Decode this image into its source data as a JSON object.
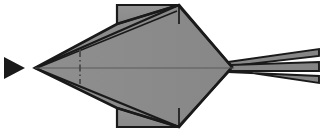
{
  "figure": {
    "title": "Origami folded model - top view",
    "type": "line-drawing",
    "width": 324,
    "height": 133,
    "background_color": "#ffffff",
    "paper_fill_color": "#8c8c8c",
    "paper_fill_color_light": "#979797",
    "paper_fill_color_dark": "#7e7e7e",
    "outline_color": "#1a1a1a",
    "crease_color": "#4a4a4a",
    "centerline_color": "#555555",
    "arrow_color": "#1a1a1a"
  },
  "markers": {
    "direction_arrow": {
      "name": "direction-arrow",
      "label": "solid triangle pointing right",
      "points": "4,57 25,68 4,79",
      "fill": "#1a1a1a"
    }
  },
  "geometry": {
    "body_outline": {
      "name": "paper-body-outline",
      "points": "35,68 118,23 178,5 232,67 178,127 118,112"
    },
    "tip_left": {
      "x": 35,
      "y": 68
    },
    "apex_top": {
      "x": 178,
      "y": 5
    },
    "apex_bottom": {
      "x": 178,
      "y": 127
    },
    "junction_right": {
      "x": 232,
      "y": 67
    },
    "flap_top": {
      "name": "top-rectangular-flap",
      "points": "118,5 178,5 178,23 118,23"
    },
    "flap_bottom": {
      "name": "bottom-rectangular-flap",
      "points": "118,127 178,127 178,110 118,110"
    },
    "tail_layers": [
      {
        "name": "tail-layer-upper",
        "points": "232,67 318,50 318,57 240,69"
      },
      {
        "name": "tail-layer-middle",
        "points": "232,67 318,62 318,68 240,69"
      },
      {
        "name": "tail-layer-lower",
        "points": "232,67 318,73 318,80 240,69"
      }
    ],
    "centerline": {
      "x1": 35,
      "y1": 68,
      "x2": 232,
      "y2": 68
    },
    "fold_axis_dashdot": {
      "x": 80,
      "y_top": 50,
      "y_bottom": 84
    }
  },
  "creases": [
    {
      "name": "crease-upper-left-long",
      "from": "35,68",
      "to": "178,5"
    },
    {
      "name": "crease-upper-left-inner",
      "from": "35,68",
      "to": "176,10"
    },
    {
      "name": "crease-lower-left-long",
      "from": "35,68",
      "to": "178,127"
    },
    {
      "name": "crease-apex-to-junction-upper",
      "from": "178,5",
      "to": "232,67"
    },
    {
      "name": "crease-apex-to-junction-lower",
      "from": "178,127",
      "to": "232,67"
    },
    {
      "name": "crease-apex-top-vertical",
      "from": "178,5",
      "to": "178,23"
    },
    {
      "name": "crease-apex-bottom-vertical",
      "from": "178,127",
      "to": "178,110"
    },
    {
      "name": "crease-flap-top-diagonal",
      "from": "118,23",
      "to": "178,5"
    },
    {
      "name": "crease-flap-bottom-diagonal",
      "from": "118,110",
      "to": "178,127"
    },
    {
      "name": "crease-top-edge-ridge",
      "from": "118,5",
      "to": "178,5"
    },
    {
      "name": "crease-bottom-edge-ridge",
      "from": "118,127",
      "to": "178,127"
    }
  ]
}
